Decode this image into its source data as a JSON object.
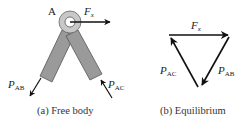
{
  "figure": {
    "panels": [
      {
        "id": "a",
        "caption": "(a) Free body",
        "joint_label": "A",
        "forces": [
          {
            "symbol": "F",
            "subscript": "x",
            "direction": "right"
          },
          {
            "symbol": "P",
            "subscript": "AB",
            "direction": "down-left, away from joint along member AB"
          },
          {
            "symbol": "P",
            "subscript": "AC",
            "direction": "up-left, toward joint along member AC"
          }
        ],
        "members": [
          "AB",
          "AC"
        ]
      },
      {
        "id": "b",
        "caption": "(b) Equilibrium",
        "type": "force triangle",
        "forces": [
          {
            "symbol": "F",
            "subscript": "x",
            "edge": "top, left to right"
          },
          {
            "symbol": "P",
            "subscript": "AB",
            "edge": "right, top to bottom"
          },
          {
            "symbol": "P",
            "subscript": "AC",
            "edge": "left, bottom to top"
          }
        ]
      }
    ],
    "colors": {
      "member_fill": "#9a9a9a",
      "member_stroke": "#555555",
      "joint_fill": "#c8c8c8",
      "arrow": "#111111"
    }
  }
}
